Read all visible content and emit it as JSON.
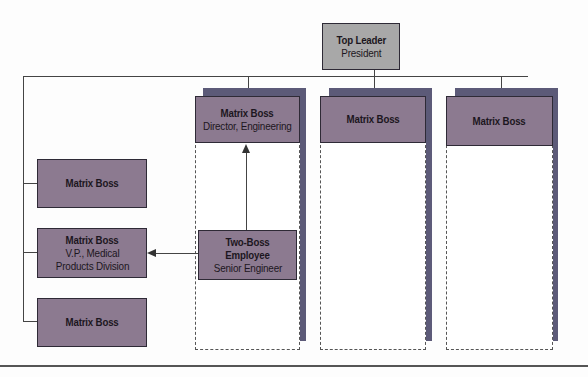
{
  "diagram": {
    "top_leader": {
      "title": "Top Leader",
      "subtitle": "President"
    },
    "columns": [
      {
        "title": "Matrix Boss",
        "subtitle": "Director, Engineering"
      },
      {
        "title": "Matrix Boss",
        "subtitle": ""
      },
      {
        "title": "Matrix Boss",
        "subtitle": ""
      }
    ],
    "left_bosses": [
      {
        "title": "Matrix Boss",
        "subtitle": ""
      },
      {
        "title": "Matrix Boss",
        "subtitle": "V.P., Medical Products Division"
      },
      {
        "title": "Matrix Boss",
        "subtitle": ""
      }
    ],
    "employee": {
      "title": "Two-Boss Employee",
      "subtitle": "Senior Engineer"
    },
    "colors": {
      "boss_fill": "#8c7a90",
      "leader_fill": "#a8a8a8",
      "shadow": "#5c5a78",
      "line": "#444444"
    }
  }
}
